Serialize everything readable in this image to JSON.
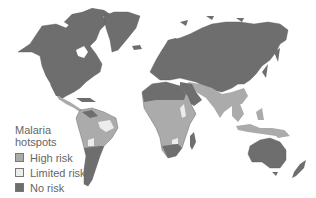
{
  "map": {
    "title": "Malaria hotspots",
    "colors": {
      "no_risk": "#6e6e6e",
      "high_risk": "#ababab",
      "limited_risk": "#ececec",
      "ocean": "#ffffff"
    }
  },
  "legend": {
    "title_line1": "Malaria",
    "title_line2": "hotspots",
    "items": [
      {
        "label": "High risk",
        "color": "#ababab"
      },
      {
        "label": "Limited risk",
        "color": "#ececec"
      },
      {
        "label": "No risk",
        "color": "#6e6e6e"
      }
    ]
  }
}
